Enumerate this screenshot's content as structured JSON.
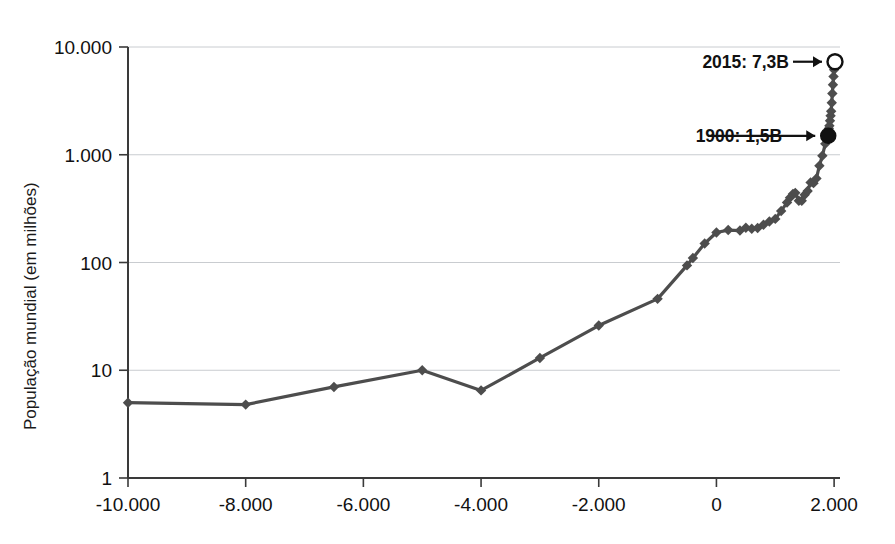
{
  "chart_data": {
    "type": "line",
    "title": "",
    "xlabel": "",
    "ylabel": "População mundial (em milhões)",
    "yscale": "log",
    "xlim": [
      -10000,
      2100
    ],
    "ylim": [
      1,
      10000
    ],
    "grid": true,
    "legend": null,
    "y_ticks": [
      {
        "value": 10000,
        "label": "10.000"
      },
      {
        "value": 1000,
        "label": "1.000"
      },
      {
        "value": 100,
        "label": "100"
      },
      {
        "value": 10,
        "label": "10"
      },
      {
        "value": 1,
        "label": "1"
      }
    ],
    "x_ticks": [
      {
        "value": -10000,
        "label": "-10.000"
      },
      {
        "value": -8000,
        "label": "-8.000"
      },
      {
        "value": -6000,
        "label": "-6.000"
      },
      {
        "value": -4000,
        "label": "-4.000"
      },
      {
        "value": -2000,
        "label": "-2.000"
      },
      {
        "value": 0,
        "label": "0"
      },
      {
        "value": 2000,
        "label": "2.000"
      }
    ],
    "series": [
      {
        "name": "População mundial",
        "marker": "diamond",
        "color": "#4d4d4d",
        "x": [
          -10000,
          -8000,
          -6500,
          -5000,
          -4000,
          -3000,
          -2000,
          -1000,
          -500,
          -400,
          -200,
          0,
          200,
          400,
          500,
          600,
          700,
          800,
          900,
          1000,
          1100,
          1200,
          1250,
          1300,
          1340,
          1400,
          1450,
          1500,
          1550,
          1600,
          1650,
          1700,
          1750,
          1800,
          1850,
          1900,
          1910,
          1920,
          1930,
          1940,
          1950,
          1960,
          1970,
          1980,
          1990,
          2000,
          2010,
          2015
        ],
        "y": [
          5,
          4.8,
          7,
          10,
          6.5,
          13,
          26,
          46,
          94,
          110,
          150,
          190,
          200,
          198,
          210,
          206,
          209,
          224,
          240,
          254,
          301,
          360,
          400,
          432,
          443,
          374,
          374,
          425,
          461,
          554,
          545,
          603,
          791,
          978,
          1262,
          1500,
          1750,
          1860,
          2070,
          2300,
          2536,
          3035,
          3700,
          4458,
          5327,
          6145,
          6930,
          7300
        ]
      }
    ],
    "annotations": [
      {
        "text": "2015: 7,3B",
        "point_x": 2015,
        "point_y": 7300,
        "marker": "open-circle"
      },
      {
        "text": "1900: 1,5B",
        "point_x": 1900,
        "point_y": 1500,
        "marker": "filled-circle"
      }
    ]
  }
}
